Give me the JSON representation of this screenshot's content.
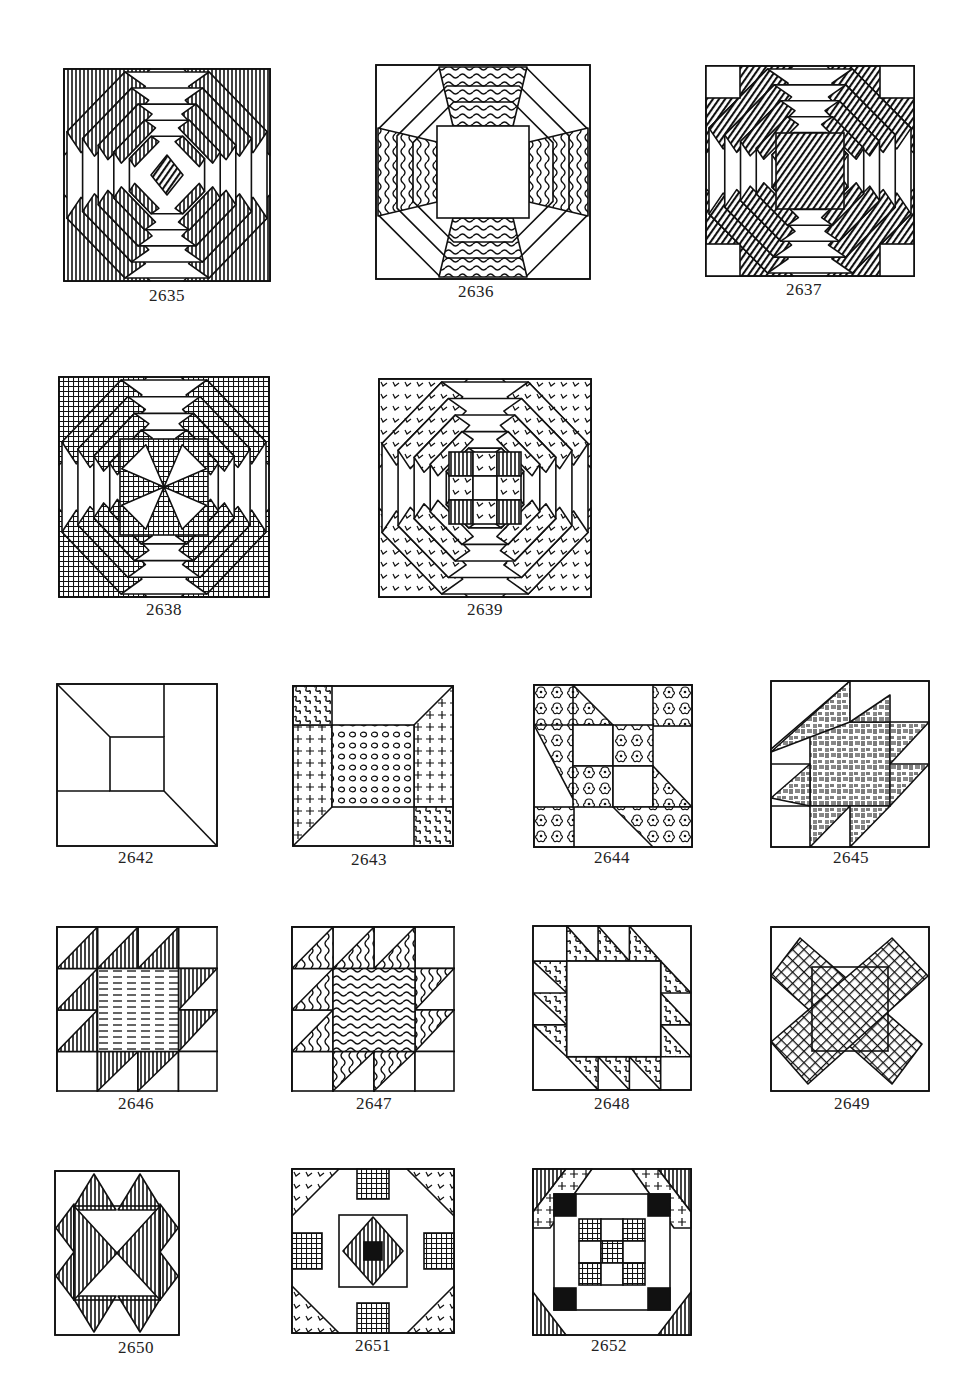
{
  "page": {
    "ink_color": "#111111",
    "paper_color": "#ffffff"
  },
  "blocks": [
    {
      "number": "2635",
      "pattern": "pineapple-vertical-hatch"
    },
    {
      "number": "2636",
      "pattern": "octagon-ring-wavy"
    },
    {
      "number": "2637",
      "pattern": "pineapple-slash-hatch-corner-squares"
    },
    {
      "number": "2638",
      "pattern": "pineapple-crosshatch-pinwheel-center"
    },
    {
      "number": "2639",
      "pattern": "pineapple-nine-patch-center"
    },
    {
      "number": "2642",
      "pattern": "plain-frame-center-square"
    },
    {
      "number": "2643",
      "pattern": "dotted-center-cross-sides"
    },
    {
      "number": "2644",
      "pattern": "floral-checker-diagonal"
    },
    {
      "number": "2645",
      "pattern": "basketweave-sawtooth-star"
    },
    {
      "number": "2646",
      "pattern": "bear-paw-horizontal-lines"
    },
    {
      "number": "2647",
      "pattern": "bear-paw-wavy"
    },
    {
      "number": "2648",
      "pattern": "sawtooth-ring-plain-center"
    },
    {
      "number": "2649",
      "pattern": "crosshatch-x-square"
    },
    {
      "number": "2650",
      "pattern": "triangle-star-vertical-hatch"
    },
    {
      "number": "2651",
      "pattern": "octagon-checker-center"
    },
    {
      "number": "2652",
      "pattern": "nine-patch-framed-corners"
    }
  ]
}
